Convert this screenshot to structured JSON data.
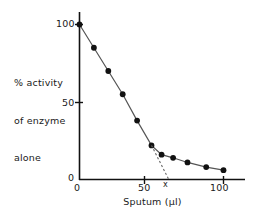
{
  "chart_data": {
    "type": "line",
    "title": "",
    "subtitle": "",
    "xlabel": "Sputum (µl)",
    "ylabel": "% activity\nof enzyme\nalone",
    "ylabel_lines": [
      "% activity",
      "of enzyme",
      "alone"
    ],
    "xlim": [
      0,
      110
    ],
    "ylim": [
      0,
      105
    ],
    "xticks": [
      0,
      50,
      100
    ],
    "xticklabels": [
      "0",
      "50",
      "100"
    ],
    "yticks": [
      0,
      50,
      100
    ],
    "yticklabels": [
      "0",
      "50",
      "100"
    ],
    "grid": false,
    "legend": "none",
    "line_color": "#555555",
    "marker_color": "#111111",
    "axis_color": "#111111",
    "series": [
      {
        "name": "% activity of enzyme alone",
        "marker": "filled-circle",
        "x": [
          0,
          10,
          20,
          30,
          40,
          50,
          57,
          65,
          75,
          88,
          100
        ],
        "y": [
          100,
          85,
          70,
          55,
          38,
          22,
          16,
          14,
          11,
          8,
          6
        ]
      }
    ],
    "annotations": [
      {
        "name": "extrapolation-line",
        "type": "dashed-line",
        "from": [
          50,
          22
        ],
        "to": [
          62,
          0
        ],
        "style": "dotted"
      },
      {
        "name": "x-intercept-marker",
        "type": "text",
        "text": "x",
        "x": 62,
        "y": 0
      }
    ]
  },
  "axis": {
    "x_tick_0": "0",
    "x_tick_50": "50",
    "x_tick_100": "100",
    "y_tick_0": "0",
    "y_tick_50": "50",
    "y_tick_100": "100",
    "x_axis_title": "Sputum (µl)",
    "y_axis_title_line1": "% activity",
    "y_axis_title_line2": "of enzyme",
    "y_axis_title_line3": "alone",
    "intercept_marker": "x"
  }
}
